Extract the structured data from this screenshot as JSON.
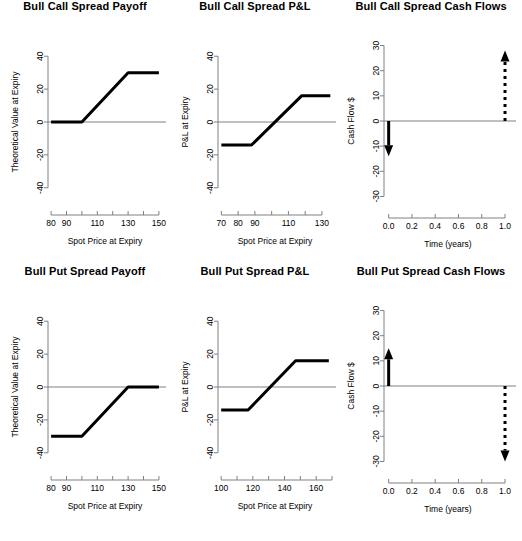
{
  "chart_data": [
    {
      "type": "line",
      "title": "Bull Call Spread Payoff",
      "xlabel": "Spot Price at Expiry",
      "ylabel": "Theoretical Value at Expiry",
      "xlim": [
        78,
        152
      ],
      "ylim": [
        -45,
        45
      ],
      "xticks": [
        80,
        90,
        100,
        110,
        120,
        130,
        140,
        150
      ],
      "xticklabels": [
        "80",
        "90",
        "",
        "110",
        "",
        "130",
        "",
        "150"
      ],
      "yticks": [
        -40,
        -20,
        0,
        20,
        40
      ],
      "yticklabels": [
        "-40",
        "-20",
        "0",
        "20",
        "40"
      ],
      "zero_line": 0,
      "grid": false,
      "legend": "none",
      "series": [
        {
          "name": "Payoff",
          "x": [
            80,
            100,
            130,
            150
          ],
          "values": [
            0,
            0,
            30,
            30
          ]
        }
      ]
    },
    {
      "type": "line",
      "title": "Bull Call Spread P&L",
      "xlabel": "Spot Price at Expiry",
      "ylabel": "P&L at Expiry",
      "xlim": [
        68,
        136
      ],
      "ylim": [
        -45,
        45
      ],
      "xticks": [
        70,
        80,
        90,
        100,
        110,
        120,
        130
      ],
      "xticklabels": [
        "70",
        "80",
        "90",
        "",
        "110",
        "",
        "130"
      ],
      "yticks": [
        -40,
        -20,
        0,
        20,
        40
      ],
      "yticklabels": [
        "-40",
        "-20",
        "0",
        "20",
        "40"
      ],
      "zero_line": 0,
      "grid": false,
      "legend": "none",
      "series": [
        {
          "name": "P&L",
          "x": [
            70,
            88,
            118,
            135
          ],
          "values": [
            -14,
            -14,
            16,
            16
          ]
        }
      ]
    },
    {
      "type": "line",
      "title": "Bull Call Spread Cash Flows",
      "xlabel": "Time (years)",
      "ylabel": "Cash Flow $",
      "xlim": [
        -0.04,
        1.06
      ],
      "ylim": [
        -33,
        33
      ],
      "xticks": [
        0.0,
        0.2,
        0.4,
        0.6,
        0.8,
        1.0
      ],
      "xticklabels": [
        "0.0",
        "0.2",
        "0.4",
        "0.6",
        "0.8",
        "1.0"
      ],
      "yticks": [
        -30,
        -20,
        -10,
        0,
        10,
        20,
        30
      ],
      "yticklabels": [
        "-30",
        "-20",
        "-10",
        "0",
        "10",
        "20",
        "30"
      ],
      "zero_line": 0,
      "grid": false,
      "legend": "none",
      "arrows": [
        {
          "name": "premium-paid",
          "x": 0.0,
          "from": 0,
          "to": -14,
          "style": "solid",
          "direction": "down"
        },
        {
          "name": "expected-payoff",
          "x": 1.0,
          "from": 0,
          "to": 28,
          "style": "dashed",
          "direction": "up"
        }
      ]
    },
    {
      "type": "line",
      "title": "Bull Put Spread Payoff",
      "xlabel": "Spot Price at Expiry",
      "ylabel": "Theoretical Value at Expiry",
      "xlim": [
        78,
        152
      ],
      "ylim": [
        -45,
        45
      ],
      "xticks": [
        80,
        90,
        100,
        110,
        120,
        130,
        140,
        150
      ],
      "xticklabels": [
        "80",
        "90",
        "",
        "110",
        "",
        "130",
        "",
        "150"
      ],
      "yticks": [
        -40,
        -20,
        0,
        20,
        40
      ],
      "yticklabels": [
        "-40",
        "-20",
        "0",
        "20",
        "40"
      ],
      "zero_line": 0,
      "grid": false,
      "legend": "none",
      "series": [
        {
          "name": "Payoff",
          "x": [
            80,
            100,
            130,
            150
          ],
          "values": [
            -30,
            -30,
            0,
            0
          ]
        }
      ]
    },
    {
      "type": "line",
      "title": "Bull Put Spread P&L",
      "xlabel": "Spot Price at Expiry",
      "ylabel": "P&L at Expiry",
      "xlim": [
        98,
        170
      ],
      "ylim": [
        -45,
        45
      ],
      "xticks": [
        100,
        110,
        120,
        130,
        140,
        150,
        160,
        170
      ],
      "xticklabels": [
        "100",
        "",
        "120",
        "",
        "140",
        "",
        "160",
        ""
      ],
      "yticks": [
        -40,
        -20,
        0,
        20,
        40
      ],
      "yticklabels": [
        "-40",
        "-20",
        "0",
        "20",
        "40"
      ],
      "zero_line": 0,
      "grid": false,
      "legend": "none",
      "series": [
        {
          "name": "P&L",
          "x": [
            100,
            117,
            147,
            168
          ],
          "values": [
            -14,
            -14,
            16,
            16
          ]
        }
      ]
    },
    {
      "type": "line",
      "title": "Bull Put Spread Cash Flows",
      "xlabel": "Time (years)",
      "ylabel": "Cash Flow $",
      "xlim": [
        -0.04,
        1.06
      ],
      "ylim": [
        -33,
        33
      ],
      "xticks": [
        0.0,
        0.2,
        0.4,
        0.6,
        0.8,
        1.0
      ],
      "xticklabels": [
        "0.0",
        "0.2",
        "0.4",
        "0.6",
        "0.8",
        "1.0"
      ],
      "yticks": [
        -30,
        -20,
        -10,
        0,
        10,
        20,
        30
      ],
      "yticklabels": [
        "-30",
        "-20",
        "-10",
        "0",
        "10",
        "20",
        "30"
      ],
      "zero_line": 0,
      "grid": false,
      "legend": "none",
      "arrows": [
        {
          "name": "premium-received",
          "x": 0.0,
          "from": 0,
          "to": 15,
          "style": "solid",
          "direction": "up"
        },
        {
          "name": "expected-payout",
          "x": 1.0,
          "from": 0,
          "to": -30,
          "style": "dashed",
          "direction": "down"
        }
      ]
    }
  ],
  "style": {
    "line_color": "#000000",
    "axis_color": "#808080",
    "background": "#ffffff"
  }
}
